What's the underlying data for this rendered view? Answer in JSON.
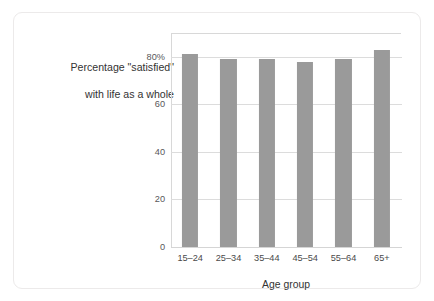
{
  "figure": {
    "background_color": "#ffffff",
    "card_border_color": "#eceaea",
    "title_line_1": "Percentage \"satisfied\"",
    "title_line_2": "with life as a whole"
  },
  "chart_data": {
    "type": "bar",
    "title": "Percentage \"satisfied\" with life as a whole",
    "categories": [
      "15–24",
      "25–34",
      "35–44",
      "45–54",
      "55–64",
      "65+"
    ],
    "values": [
      81,
      79,
      79,
      78,
      79,
      83
    ],
    "xlabel": "Age group",
    "ylabel": "",
    "ylim": [
      0,
      90
    ],
    "yticks": [
      0,
      20,
      40,
      60,
      80
    ],
    "ytick_labels": [
      "0",
      "20",
      "40",
      "60",
      "80%"
    ],
    "grid": true,
    "legend": false,
    "bar_color": "#9a9a9a",
    "gridline_color": "#dcdcdc"
  }
}
